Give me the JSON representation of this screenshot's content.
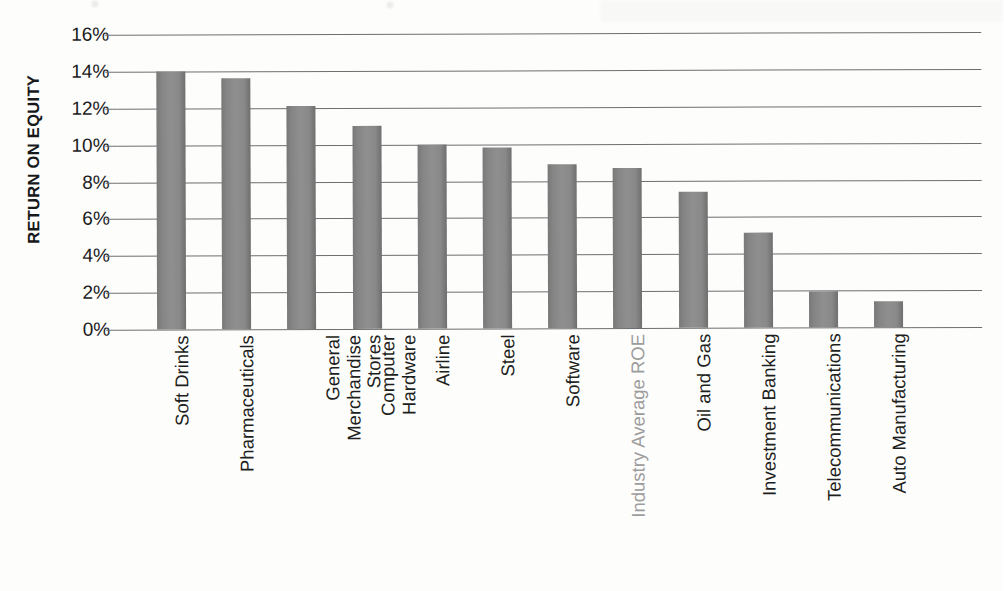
{
  "chart_data": {
    "type": "bar",
    "title": "",
    "xlabel": "",
    "ylabel": "RETURN ON EQUITY",
    "ylim": [
      0,
      16
    ],
    "ytick_labels": [
      "16%",
      "14%",
      "12%",
      "10%",
      "8%",
      "6%",
      "4%",
      "2%",
      "0%"
    ],
    "ytick_values": [
      16,
      14,
      12,
      10,
      8,
      6,
      4,
      2,
      0
    ],
    "grid": true,
    "legend": "none",
    "categories": [
      "Soft Drinks",
      "Pharmaceuticals",
      "General Merchandise Stores",
      "Computer Hardware",
      "Airline",
      "Steel",
      "Software",
      "Industry Average ROE",
      "Oil and Gas",
      "Investment Banking",
      "Telecommunications",
      "Auto Manufacturing"
    ],
    "values": [
      14.0,
      13.6,
      12.1,
      11.0,
      10.0,
      9.8,
      8.9,
      8.7,
      7.35,
      5.15,
      1.95,
      1.4
    ],
    "category_lines": [
      [
        "Soft Drinks"
      ],
      [
        "Pharmaceuticals"
      ],
      [
        "General",
        "Merchandise",
        "Stores"
      ],
      [
        "Computer",
        "Hardware"
      ],
      [
        "Airline"
      ],
      [
        "Steel"
      ],
      [
        "Software"
      ],
      [
        "Industry Average ROE"
      ],
      [
        "Oil and Gas"
      ],
      [
        "Investment Banking"
      ],
      [
        "Telecommunications"
      ],
      [
        "Auto Manufacturing"
      ]
    ],
    "highlight_category": "Industry Average ROE",
    "colors": {
      "bar_fill": "#8a8a8a",
      "bar_edge_dark": "#6f6f6f",
      "gridline": "#6e6f70",
      "tick_text": "#1a1b1d",
      "axis_title": "#17181a",
      "muted_label": "#9c9c9c",
      "background": "#fdfdfc"
    }
  }
}
